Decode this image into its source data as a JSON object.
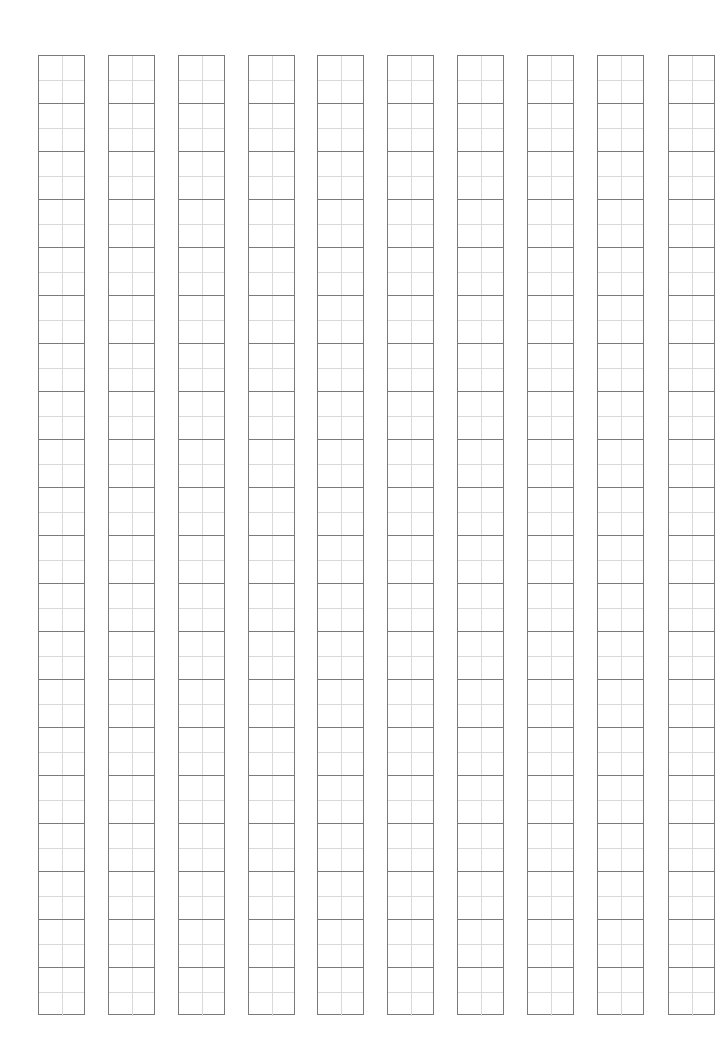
{
  "sheet": {
    "type": "tianzige-practice-grid",
    "columns": 10,
    "rows_per_column": 20,
    "column_left_positions": [
      38,
      108,
      178,
      248,
      317,
      387,
      457,
      527,
      597,
      668
    ],
    "grid_top": 55,
    "cell_width": 47,
    "cell_height": 48,
    "colors": {
      "border": "#7a7a7a",
      "guide": "#d9d9d9",
      "background": "#ffffff"
    }
  }
}
